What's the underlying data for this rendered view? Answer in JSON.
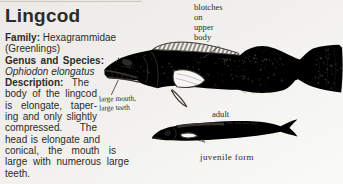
{
  "colors": {
    "paper": "#f1f0ec",
    "ink": "#2d2b28",
    "line_art": "#3b3833"
  },
  "article": {
    "title": "Lingcod",
    "family_label": "Family:",
    "family_value": "Hexagrammidae",
    "family_note": "(Greenlings)",
    "genus_label": "Genus and Species:",
    "species_name": "Ophiodon elongatus",
    "description_label": "Description:",
    "description_intro": "The",
    "description_lines": [
      "body of the lingcod",
      "is elongate, taper-",
      "ing and only slightly",
      "compressed.  The",
      "head is elongate and",
      "conical, the mouth is",
      "large with numerous large",
      "teeth."
    ]
  },
  "figure": {
    "blotches_label_lines": [
      "blotches",
      "on",
      "upper",
      "body"
    ],
    "mouth_label_lines": [
      "large mouth,",
      "large teeth"
    ],
    "adult_label": "adult",
    "juvenile_label": "juvenile form"
  }
}
